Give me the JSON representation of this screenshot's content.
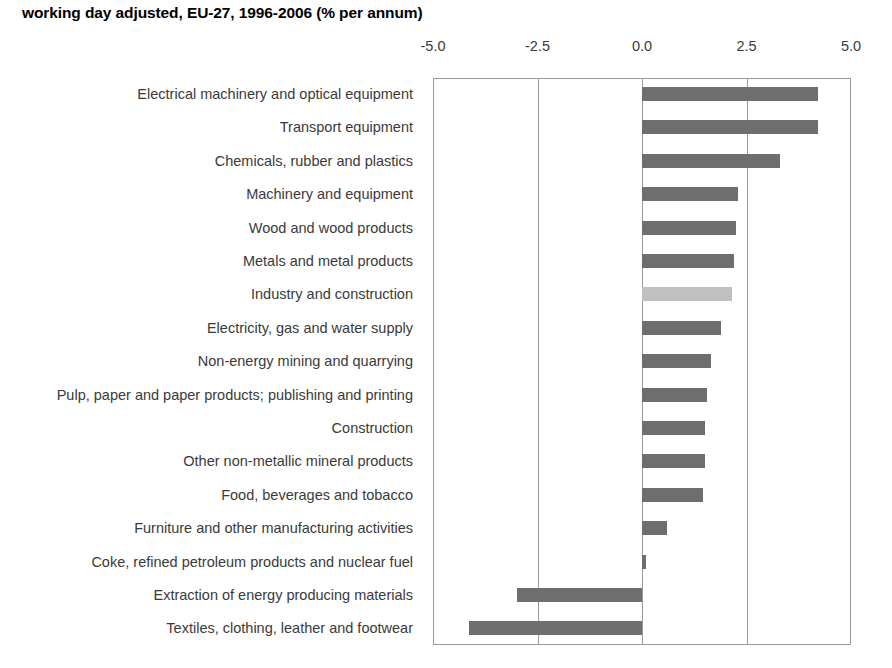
{
  "chart_data": {
    "type": "bar",
    "orientation": "horizontal",
    "title": "working day adjusted, EU-27, 1996-2006 (% per annum)",
    "xlabel": "",
    "ylabel": "",
    "xlim": [
      -5.0,
      5.0
    ],
    "xticks": [
      -5.0,
      -2.5,
      0.0,
      2.5,
      5.0
    ],
    "xtick_labels": [
      "-5.0",
      "-2.5",
      "0.0",
      "2.5",
      "5.0"
    ],
    "grid": true,
    "legend": "none",
    "bar_color": "#6e6e6e",
    "highlight_color": "#c0c0c0",
    "highlight_category": "Industry and construction",
    "categories": [
      "Electrical machinery and optical equipment",
      "Transport equipment",
      "Chemicals, rubber and plastics",
      "Machinery and equipment",
      "Wood and wood products",
      "Metals and metal products",
      "Industry and construction",
      "Electricity, gas and water supply",
      "Non-energy mining and quarrying",
      "Pulp, paper and paper products; publishing and printing",
      "Construction",
      "Other non-metallic mineral products",
      "Food, beverages and tobacco",
      "Furniture and other manufacturing activities",
      "Coke, refined petroleum products and nuclear fuel",
      "Extraction of energy producing materials",
      "Textiles, clothing, leather and footwear"
    ],
    "values": [
      4.2,
      4.2,
      3.3,
      2.3,
      2.25,
      2.2,
      2.15,
      1.9,
      1.65,
      1.55,
      1.5,
      1.5,
      1.45,
      0.6,
      0.1,
      -3.0,
      -4.15
    ]
  }
}
